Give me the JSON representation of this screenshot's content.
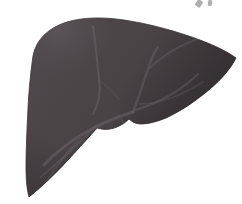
{
  "figure": {
    "title": "Liver",
    "view": "anterior view",
    "width": 242,
    "height": 204,
    "background_color": "#ffffff",
    "style": "flat desaturated medical illustration"
  },
  "palette": {
    "organ_base": "#4a4447",
    "organ_base_light": "#575054",
    "organ_shadow": "#3b3639",
    "organ_edge": "#332e31",
    "vessel_light": "#6f666c",
    "vessel_mid": "#635b60",
    "fissure_line": "#6b6368",
    "highlight": "#5f575c",
    "artifact_ink": "#6d6a6c",
    "background": "#ffffff"
  },
  "parts": {
    "right_lobe": {
      "label": "Right lobe",
      "description": "large dome-shaped mass occupying the left and centre of the image"
    },
    "left_lobe": {
      "label": "Left lobe",
      "description": "tapering wing extending to the right and down to a point"
    },
    "falciform_ligament": {
      "label": "Falciform ligament",
      "description": "vertical pale fissure line dividing the two lobes"
    },
    "gallbladder_lobe": {
      "label": "Gallbladder / quadrate lobe bulge",
      "description": "small rounded protrusion on the inferior border near centre-right"
    },
    "inferior_border": {
      "label": "Inferior border",
      "description": "sharp lower margin running down-left to an acute point"
    },
    "porta_hepatis": {
      "label": "Porta hepatis",
      "description": "central hilum where the vessel branches converge"
    }
  },
  "vessels": [
    {
      "name": "falciform-fissure",
      "stroke": "#6b6368",
      "width": 2.1,
      "opacity": 0.52,
      "d": "M 93 26 C 96 46, 97 62, 99 78 C 101 92, 99 104, 93 114"
    },
    {
      "name": "hepatic-vein-main",
      "stroke": "#6f666c",
      "width": 3.0,
      "opacity": 0.5,
      "d": "M 133 112 C 120 116, 104 122, 88 131 C 72 140, 56 152, 44 165"
    },
    {
      "name": "hepatic-vein-branch-upper",
      "stroke": "#6b626a",
      "width": 2.4,
      "opacity": 0.46,
      "d": "M 133 112 C 138 100, 142 86, 147 72 C 150 62, 153 54, 158 47"
    },
    {
      "name": "hepatic-vein-branch-right",
      "stroke": "#6b626a",
      "width": 2.3,
      "opacity": 0.44,
      "d": "M 136 110 C 148 106, 160 101, 172 94 C 182 88, 191 81, 198 74"
    },
    {
      "name": "portal-branch-lower-left",
      "stroke": "#675f65",
      "width": 2.2,
      "opacity": 0.42,
      "d": "M 96 126 C 86 136, 75 147, 64 157 C 56 164, 48 171, 41 177"
    },
    {
      "name": "portal-branch-fork",
      "stroke": "#645c62",
      "width": 1.9,
      "opacity": 0.4,
      "d": "M 80 138 C 72 147, 64 156, 57 166 C 52 173, 48 179, 45 185"
    },
    {
      "name": "segmental-branch-right-upper",
      "stroke": "#6b626a",
      "width": 2.0,
      "opacity": 0.4,
      "d": "M 150 68 C 158 60, 168 53, 179 47 C 189 42, 199 38, 208 36"
    },
    {
      "name": "segmental-branch-right-lower",
      "stroke": "#665e64",
      "width": 1.8,
      "opacity": 0.36,
      "d": "M 140 104 C 152 104, 164 101, 176 96 C 186 92, 195 87, 203 82"
    },
    {
      "name": "vein-twig-centre",
      "stroke": "#6a6167",
      "width": 1.6,
      "opacity": 0.36,
      "d": "M 121 118 C 124 124, 126 129, 127 135"
    },
    {
      "name": "vein-twig-upper-left",
      "stroke": "#635b61",
      "width": 1.5,
      "opacity": 0.3,
      "d": "M 99 80 C 106 85, 113 92, 119 99"
    }
  ],
  "artifacts": [
    {
      "name": "pen-stroke-upper-right-a",
      "x": 196,
      "y": 0,
      "width": 6,
      "height": 7,
      "rotate": 34
    },
    {
      "name": "pen-stroke-upper-right-b",
      "x": 208,
      "y": 0,
      "width": 4,
      "height": 6,
      "rotate": 8
    }
  ],
  "geometry": {
    "organ_outline": "M 33 56 C 36 40, 48 28, 67 22 C 84 17, 104 17, 124 20 C 150 24, 176 31, 200 40 C 216 46, 228 52, 236 58 C 231 68, 222 79, 210 89 C 196 101, 181 111, 166 118 C 156 122, 148 124, 141 124 C 136 124, 132 122, 129 119 C 126 122, 122 125, 117 127 C 110 130, 103 130, 97 128 C 90 136, 80 147, 69 159 C 57 172, 43 186, 29 197 C 27 190, 26 180, 26 168 C 26 150, 27 128, 28 108 C 29 88, 31 70, 33 56 Z",
    "gallbladder_bulge": "M 97 128 C 101 131, 107 132, 113 130 C 119 128, 125 124, 129 119 C 126 122, 122 125, 117 127 C 110 130, 103 130, 97 128 Z"
  }
}
